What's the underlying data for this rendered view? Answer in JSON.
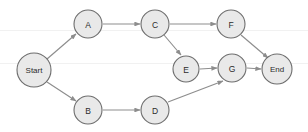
{
  "diagram": {
    "type": "directed-graph",
    "canvas": {
      "width": 308,
      "height": 132,
      "background": "#ffffff"
    },
    "style": {
      "node_fill": "#e9e9e9",
      "node_stroke": "#6d6d6d",
      "edge_color": "#8d8d8d",
      "label_color": "#2b2b2b"
    },
    "nodes": [
      {
        "id": "start",
        "label": "Start",
        "cx": 34,
        "cy": 70,
        "r": 17
      },
      {
        "id": "a",
        "label": "A",
        "cx": 88,
        "cy": 24,
        "r": 14
      },
      {
        "id": "c",
        "label": "C",
        "cx": 155,
        "cy": 24,
        "r": 14
      },
      {
        "id": "f",
        "label": "F",
        "cx": 231,
        "cy": 24,
        "r": 14
      },
      {
        "id": "e",
        "label": "E",
        "cx": 186,
        "cy": 69,
        "r": 13
      },
      {
        "id": "g",
        "label": "G",
        "cx": 232,
        "cy": 68,
        "r": 14
      },
      {
        "id": "end",
        "label": "End",
        "cx": 277,
        "cy": 69,
        "r": 15
      },
      {
        "id": "b",
        "label": "B",
        "cx": 88,
        "cy": 110,
        "r": 14
      },
      {
        "id": "d",
        "label": "D",
        "cx": 155,
        "cy": 110,
        "r": 14
      }
    ],
    "edges": [
      {
        "id": "start-a",
        "from": "start",
        "to": "a",
        "x1": 47,
        "y1": 59,
        "x2": 76,
        "y2": 34
      },
      {
        "id": "start-b",
        "from": "start",
        "to": "b",
        "x1": 47,
        "y1": 82,
        "x2": 76,
        "y2": 101
      },
      {
        "id": "a-c",
        "from": "a",
        "to": "c",
        "x1": 103,
        "y1": 24,
        "x2": 140,
        "y2": 24
      },
      {
        "id": "c-f",
        "from": "c",
        "to": "f",
        "x1": 170,
        "y1": 24,
        "x2": 216,
        "y2": 24
      },
      {
        "id": "c-e",
        "from": "c",
        "to": "e",
        "x1": 164,
        "y1": 35,
        "x2": 181,
        "y2": 55
      },
      {
        "id": "b-d",
        "from": "b",
        "to": "d",
        "x1": 103,
        "y1": 110,
        "x2": 140,
        "y2": 110
      },
      {
        "id": "d-g",
        "from": "d",
        "to": "g",
        "x1": 168,
        "y1": 102,
        "x2": 223,
        "y2": 81
      },
      {
        "id": "e-g",
        "from": "e",
        "to": "g",
        "x1": 200,
        "y1": 69,
        "x2": 217,
        "y2": 68
      },
      {
        "id": "f-end",
        "from": "f",
        "to": "end",
        "x1": 241,
        "y1": 35,
        "x2": 268,
        "y2": 58
      },
      {
        "id": "g-end",
        "from": "g",
        "to": "end",
        "x1": 247,
        "y1": 68,
        "x2": 261,
        "y2": 69
      }
    ]
  }
}
